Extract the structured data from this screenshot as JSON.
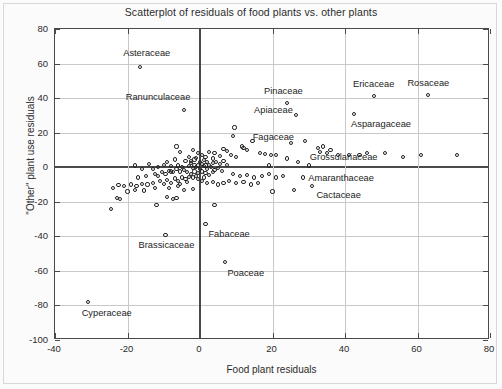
{
  "chart_data": {
    "type": "scatter",
    "title": "Scatterplot of residuals of food plants vs. other plants",
    "xlabel": "Food plant residuals",
    "ylabel": "\"Other\" plant use residuals",
    "xlim": [
      -40,
      80
    ],
    "ylim": [
      -100,
      80
    ],
    "xticks": [
      -40,
      -20,
      0,
      20,
      40,
      60,
      80
    ],
    "yticks": [
      -100,
      -80,
      -60,
      -40,
      -20,
      0,
      20,
      40,
      60,
      80
    ],
    "xtick_labels": [
      "-40",
      "-20",
      "0",
      "20",
      "40",
      "60",
      "80"
    ],
    "ytick_labels": [
      "-100",
      "-80",
      "-60",
      "-40",
      "-20",
      "0",
      "20",
      "40",
      "60",
      "80"
    ],
    "grid": true,
    "legend": null,
    "marker": "open-circle",
    "zero_reference_lines": {
      "x": 0,
      "y": 0
    },
    "labeled_points": [
      {
        "label": "Asteraceae",
        "x": -16.5,
        "y": 58,
        "label_dx": -17,
        "label_dy": -13
      },
      {
        "label": "Ranunculaceae",
        "x": -4.5,
        "y": 33,
        "label_dx": -58,
        "label_dy": -12
      },
      {
        "label": "Pinaceae",
        "x": 24,
        "y": 37,
        "label_dx": -23,
        "label_dy": -11
      },
      {
        "label": "Ericaceae",
        "x": 48,
        "y": 41,
        "label_dx": -21,
        "label_dy": -11
      },
      {
        "label": "Rosaceae",
        "x": 63,
        "y": 42,
        "label_dx": -21,
        "label_dy": -11
      },
      {
        "label": "Apiaceae",
        "x": 26.5,
        "y": 30,
        "label_dx": -42,
        "label_dy": -4
      },
      {
        "label": "Asparagaceae",
        "x": 42.5,
        "y": 31,
        "label_dx": -3,
        "label_dy": 11
      },
      {
        "label": "Fagaceae",
        "x": 25,
        "y": 14,
        "label_dx": -38,
        "label_dy": -5
      },
      {
        "label": "Grossulariaceae",
        "x": 32.5,
        "y": 11,
        "label_dx": -8,
        "label_dy": 10
      },
      {
        "label": "Amaranthaceae",
        "x": 28.5,
        "y": -6,
        "label_dx": 5,
        "label_dy": 1
      },
      {
        "label": "Cactaceae",
        "x": 31,
        "y": -11,
        "label_dx": 4,
        "label_dy": 10
      },
      {
        "label": "Brassicaceae",
        "x": -9.5,
        "y": -39,
        "label_dx": -27,
        "label_dy": 11
      },
      {
        "label": "Fabaceae",
        "x": 1.5,
        "y": -33,
        "label_dx": 3,
        "label_dy": 11
      },
      {
        "label": "Poaceae",
        "x": 7,
        "y": -55,
        "label_dx": 2,
        "label_dy": 12
      },
      {
        "label": "Cyperaceae",
        "x": -31,
        "y": -78,
        "label_dx": -6,
        "label_dy": 12
      }
    ],
    "points": [
      [
        -16.5,
        58
      ],
      [
        -4.5,
        33
      ],
      [
        24,
        37
      ],
      [
        48,
        41
      ],
      [
        63,
        42
      ],
      [
        26.5,
        30
      ],
      [
        42.5,
        31
      ],
      [
        25,
        14
      ],
      [
        32.5,
        11
      ],
      [
        28.5,
        -6
      ],
      [
        31,
        -11
      ],
      [
        -9.5,
        -39
      ],
      [
        1.5,
        -33
      ],
      [
        7,
        -55
      ],
      [
        -31,
        -78
      ],
      [
        9.5,
        23
      ],
      [
        9,
        18
      ],
      [
        14.5,
        15
      ],
      [
        11.5,
        12
      ],
      [
        12,
        11
      ],
      [
        13,
        10
      ],
      [
        7.5,
        9.5
      ],
      [
        6.5,
        10.5
      ],
      [
        16.5,
        8
      ],
      [
        18,
        7.5
      ],
      [
        19.5,
        7
      ],
      [
        21,
        7
      ],
      [
        8.5,
        7
      ],
      [
        10,
        6
      ],
      [
        5.5,
        6.5
      ],
      [
        4,
        8
      ],
      [
        2.5,
        9
      ],
      [
        3.5,
        5
      ],
      [
        -2,
        10
      ],
      [
        -0.5,
        8
      ],
      [
        0.5,
        7
      ],
      [
        1.5,
        6
      ],
      [
        -1,
        5.5
      ],
      [
        -3,
        6
      ],
      [
        -5.5,
        9
      ],
      [
        -7,
        4.5
      ],
      [
        -9,
        3
      ],
      [
        -4,
        3.5
      ],
      [
        -2.5,
        2.5
      ],
      [
        -1.5,
        1.5
      ],
      [
        -0.5,
        1
      ],
      [
        0.5,
        2
      ],
      [
        1.5,
        1
      ],
      [
        2.5,
        1.5
      ],
      [
        3.5,
        2.5
      ],
      [
        4.5,
        3
      ],
      [
        5.5,
        2
      ],
      [
        6.5,
        3.5
      ],
      [
        7.5,
        1.5
      ],
      [
        -6,
        1
      ],
      [
        -8,
        0.5
      ],
      [
        -10,
        1.5
      ],
      [
        -11.5,
        0
      ],
      [
        -13,
        -1
      ],
      [
        -3,
        0.5
      ],
      [
        -2,
        -0.5
      ],
      [
        -1,
        0
      ],
      [
        0,
        -1
      ],
      [
        1,
        0.5
      ],
      [
        2,
        -1
      ],
      [
        3,
        0
      ],
      [
        4,
        -1.5
      ],
      [
        5,
        -0.5
      ],
      [
        6,
        -2
      ],
      [
        -4.5,
        -1.5
      ],
      [
        -5.5,
        -2.5
      ],
      [
        -6.5,
        -1
      ],
      [
        -7.5,
        -3
      ],
      [
        -8.5,
        -2
      ],
      [
        -9.5,
        -4
      ],
      [
        -10.5,
        -3
      ],
      [
        -11.5,
        -5
      ],
      [
        -12.5,
        -4
      ],
      [
        -3.5,
        -3
      ],
      [
        -2.5,
        -4
      ],
      [
        -1.5,
        -2.5
      ],
      [
        -0.5,
        -3.5
      ],
      [
        0.5,
        -2.5
      ],
      [
        1.5,
        -3.5
      ],
      [
        2.5,
        -4.5
      ],
      [
        3.5,
        -3
      ],
      [
        -1,
        -5
      ],
      [
        -2,
        -6
      ],
      [
        -3,
        -5.5
      ],
      [
        -4,
        -7
      ],
      [
        -5,
        -6
      ],
      [
        -6,
        -8
      ],
      [
        -7,
        -6.5
      ],
      [
        -8,
        -9
      ],
      [
        -9,
        -7.5
      ],
      [
        -10,
        -9.5
      ],
      [
        -11,
        -8
      ],
      [
        -13,
        -9
      ],
      [
        -14.5,
        -10
      ],
      [
        -16,
        -9.5
      ],
      [
        -17.5,
        -11
      ],
      [
        -19,
        -10
      ],
      [
        -21,
        -11
      ],
      [
        -22.5,
        -10.5
      ],
      [
        -24,
        -12
      ],
      [
        -18,
        -13
      ],
      [
        -15.5,
        -13.5
      ],
      [
        -12.5,
        -12
      ],
      [
        -20,
        -14
      ],
      [
        -23,
        -18
      ],
      [
        -22,
        -18.5
      ],
      [
        -24.5,
        -24
      ],
      [
        -12,
        -22
      ],
      [
        -8.5,
        -12
      ],
      [
        -6,
        -11
      ],
      [
        -4.5,
        -13
      ],
      [
        -2,
        -12.5
      ],
      [
        0.5,
        -8
      ],
      [
        2,
        -9
      ],
      [
        3.5,
        -8.5
      ],
      [
        5,
        -10
      ],
      [
        6.5,
        -9
      ],
      [
        8,
        -8
      ],
      [
        10,
        -9
      ],
      [
        12,
        -8.5
      ],
      [
        14,
        -10
      ],
      [
        16,
        -9
      ],
      [
        9,
        -4
      ],
      [
        11,
        -5
      ],
      [
        13,
        -4.5
      ],
      [
        15,
        -6
      ],
      [
        17,
        -5
      ],
      [
        19,
        -4
      ],
      [
        21,
        -6
      ],
      [
        23,
        -5
      ],
      [
        20,
        -14
      ],
      [
        26,
        -13
      ],
      [
        4,
        -22
      ],
      [
        -8,
        -2.5
      ],
      [
        -5,
        0
      ],
      [
        24,
        5
      ],
      [
        19,
        1
      ],
      [
        27,
        3
      ],
      [
        30,
        1
      ],
      [
        35,
        8
      ],
      [
        38,
        7
      ],
      [
        41,
        7
      ],
      [
        33,
        9
      ],
      [
        36,
        10
      ],
      [
        44,
        7
      ],
      [
        46,
        8
      ],
      [
        51,
        8
      ],
      [
        56,
        6
      ],
      [
        61,
        7
      ],
      [
        71,
        7
      ],
      [
        29,
        15
      ],
      [
        34,
        12
      ],
      [
        -14,
        2
      ],
      [
        -16,
        -1
      ],
      [
        -18,
        1
      ],
      [
        -6.5,
        12
      ],
      [
        -9,
        -17
      ],
      [
        1,
        4
      ],
      [
        2,
        3
      ],
      [
        -1.5,
        4.5
      ],
      [
        0,
        3
      ],
      [
        -2.5,
        3.5
      ],
      [
        -0.5,
        -7
      ],
      [
        1,
        -6
      ],
      [
        -3.5,
        -8.5
      ],
      [
        -5.5,
        -9.5
      ],
      [
        -6.5,
        -18
      ],
      [
        -7.5,
        -18.5
      ],
      [
        -15,
        -5
      ],
      [
        -17,
        -6
      ]
    ]
  }
}
